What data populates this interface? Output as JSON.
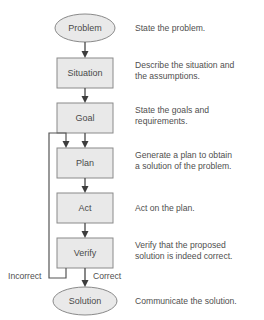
{
  "diagram": {
    "colors": {
      "shape_fill": "#e9e9e9",
      "shape_stroke": "#8a8a8a",
      "connector": "#555555",
      "text": "#4f4f4f",
      "background": "#ffffff"
    },
    "nodes": [
      {
        "id": "problem",
        "label": "Problem",
        "shape": "ellipse",
        "description": "State the problem."
      },
      {
        "id": "situation",
        "label": "Situation",
        "shape": "rect",
        "description": "Describe the situation and the assumptions."
      },
      {
        "id": "goal",
        "label": "Goal",
        "shape": "rect",
        "description": "State the goals and requirements."
      },
      {
        "id": "plan",
        "label": "Plan",
        "shape": "rect",
        "description": "Generate a plan to obtain a solution of the problem."
      },
      {
        "id": "act",
        "label": "Act",
        "shape": "rect",
        "description": "Act on the plan."
      },
      {
        "id": "verify",
        "label": "Verify",
        "shape": "rect",
        "description": "Verify that the proposed solution is indeed correct."
      },
      {
        "id": "solution",
        "label": "Solution",
        "shape": "ellipse",
        "description": "Communicate the solution."
      }
    ],
    "descriptions": {
      "problem": "State the problem.",
      "situation_line1": "Describe the situation and",
      "situation_line2": "the assumptions.",
      "goal_line1": "State the goals and",
      "goal_line2": "requirements.",
      "plan_line1": "Generate a plan to obtain",
      "plan_line2": "a solution of the problem.",
      "act": "Act on the plan.",
      "verify_line1": "Verify that the proposed",
      "verify_line2": "solution is indeed correct.",
      "solution": "Communicate the solution."
    },
    "branches": {
      "incorrect": "Incorrect",
      "correct": "Correct"
    }
  }
}
